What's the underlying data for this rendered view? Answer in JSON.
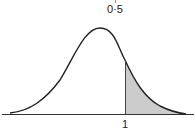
{
  "diagram": {
    "type": "normal-distribution-curve",
    "top_label": "0·5",
    "x_marker_label": "1",
    "shaded_region": "right tail, x > 1",
    "colors": {
      "curve": "#222222",
      "shade": "#cccccc",
      "axis": "#333333"
    }
  }
}
